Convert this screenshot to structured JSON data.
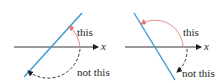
{
  "panels": [
    {
      "id": "left",
      "axis_label": "x",
      "correct_angle_label": "this",
      "incorrect_angle_label": "not this",
      "line_direction": "positive-slope"
    },
    {
      "id": "right",
      "axis_label": "x",
      "correct_angle_label": "this",
      "incorrect_angle_label": "not this",
      "line_direction": "negative-slope"
    }
  ],
  "colors": {
    "line": "#3a9bd0",
    "correct_arc": "#e8797a",
    "axis": "#231f20",
    "incorrect_arc": "#231f20"
  }
}
